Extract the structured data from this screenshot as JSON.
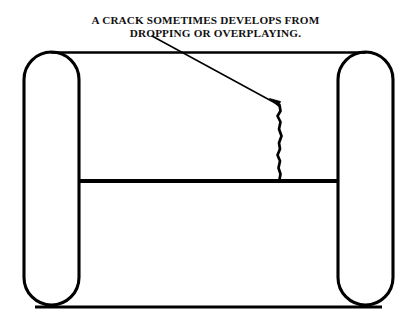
{
  "figure": {
    "kind": "line-art-diagram",
    "background_color": "#ffffff",
    "ink_color": "#000000",
    "caption": {
      "line1": "A CRACK SOMETIMES DEVELOPS FROM",
      "line2": "DROPPING OR OVERPLAYING."
    },
    "parts": [
      {
        "name": "left-rim-capsule",
        "label": "left rim"
      },
      {
        "name": "right-rim-capsule",
        "label": "right rim"
      },
      {
        "name": "top-edge-line",
        "label": "top edge"
      },
      {
        "name": "bottom-edge-line",
        "label": "bottom edge"
      },
      {
        "name": "middle-rail-bar",
        "label": "middle rail"
      },
      {
        "name": "crack-line",
        "label": "crack"
      },
      {
        "name": "leader-line",
        "label": "leader"
      },
      {
        "name": "arrowhead",
        "label": "arrow"
      }
    ],
    "geometry": {
      "left_capsule": {
        "x": 24,
        "y": 52,
        "width": 55,
        "height": 253,
        "radius": 27.5
      },
      "right_capsule": {
        "x": 338,
        "y": 52,
        "width": 55,
        "height": 253,
        "radius": 27.5
      },
      "top_line": {
        "x1": 51,
        "y1": 52.5,
        "x2": 366,
        "y2": 52.5,
        "stroke": 2.6
      },
      "bottom_line": {
        "x1": 35,
        "y1": 307,
        "x2": 382,
        "y2": 307,
        "stroke": 2.8
      },
      "middle_bar": {
        "x1": 79,
        "y1": 181,
        "x2": 338,
        "y2": 181,
        "stroke": 4.2
      },
      "crack_path": "M279.5,105 L280.5,111 L277.5,116 L280.5,122 L279,129 L281.5,136 L279,143 L280,149 L277.5,155 L280,161 L278.5,168 L280.5,174 L279.5,179.5",
      "leader_line": {
        "x1": 152,
        "y1": 36,
        "x2": 277,
        "y2": 104,
        "stroke": 1.5
      },
      "arrowhead_path": "M277.5,105.5 L270.5,99.5 L279.5,101.5 Z"
    }
  }
}
